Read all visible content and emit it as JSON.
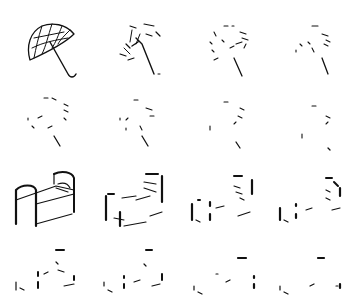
{
  "figure": {
    "layout": {
      "rows": 4,
      "cols": 4
    },
    "rows": [
      {
        "subject": "umbrella",
        "cells": [
          "umbrella-full",
          "umbrella-sparse-1",
          "umbrella-sparse-2",
          "umbrella-sparse-3"
        ]
      },
      {
        "subject": "umbrella",
        "cells": [
          "umbrella-sparse-4",
          "umbrella-sparse-5",
          "umbrella-sparse-6",
          "umbrella-sparse-7"
        ]
      },
      {
        "subject": "bed",
        "cells": [
          "bed-full",
          "bed-sparse-1",
          "bed-sparse-2",
          "bed-sparse-3"
        ]
      },
      {
        "subject": "bed",
        "cells": [
          "bed-sparse-4",
          "bed-sparse-5",
          "bed-sparse-6",
          "bed-sparse-7"
        ]
      }
    ],
    "stroke_color": "#111111",
    "background": "#ffffff"
  }
}
